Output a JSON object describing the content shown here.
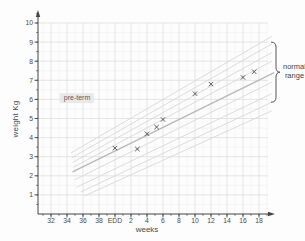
{
  "chart_data": {
    "type": "scatter",
    "title": "",
    "xlabel": "weeks",
    "ylabel": "weight Kg",
    "point_marker": "x",
    "grid": "on",
    "ylim": [
      0,
      10.5
    ],
    "y_ticks": [
      1,
      2,
      3,
      4,
      5,
      6,
      7,
      8,
      9,
      10
    ],
    "x_ticks": [
      {
        "label": "32",
        "w": -8
      },
      {
        "label": "34",
        "w": -6
      },
      {
        "label": "36",
        "w": -4
      },
      {
        "label": "38",
        "w": -2
      },
      {
        "label": "EDD",
        "w": 0
      },
      {
        "label": "2",
        "w": 2
      },
      {
        "label": "4",
        "w": 4
      },
      {
        "label": "6",
        "w": 6
      },
      {
        "label": "8",
        "w": 8
      },
      {
        "label": "10",
        "w": 10
      },
      {
        "label": "12",
        "w": 12
      },
      {
        "label": "14",
        "w": 14
      },
      {
        "label": "16",
        "w": 16
      },
      {
        "label": "18",
        "w": 18
      }
    ],
    "points": [
      {
        "week": 0,
        "kg": 3.45
      },
      {
        "week": 2.8,
        "kg": 3.4
      },
      {
        "week": 4,
        "kg": 4.2
      },
      {
        "week": 5.2,
        "kg": 4.55
      },
      {
        "week": 6,
        "kg": 4.95
      },
      {
        "week": 10,
        "kg": 6.3
      },
      {
        "week": 12,
        "kg": 6.8
      },
      {
        "week": 16,
        "kg": 7.15
      },
      {
        "week": 17.4,
        "kg": 7.45
      }
    ],
    "centile_band": {
      "lines": [
        {
          "w1": -3.8,
          "v1": 0.95,
          "w2": 19.6,
          "v2": 5.4,
          "emphasis": false
        },
        {
          "w1": -4.3,
          "v1": 1.15,
          "w2": 19.6,
          "v2": 5.85,
          "emphasis": false
        },
        {
          "w1": -4.8,
          "v1": 1.4,
          "w2": 19.6,
          "v2": 6.3,
          "emphasis": false
        },
        {
          "w1": -5.0,
          "v1": 1.8,
          "w2": 19.6,
          "v2": 6.9,
          "emphasis": false
        },
        {
          "w1": -5.3,
          "v1": 2.2,
          "w2": 19.9,
          "v2": 7.4,
          "emphasis": true
        },
        {
          "w1": -5.2,
          "v1": 2.45,
          "w2": 19.6,
          "v2": 8.0,
          "emphasis": false
        },
        {
          "w1": -5.3,
          "v1": 2.7,
          "w2": 19.6,
          "v2": 8.45,
          "emphasis": false
        },
        {
          "w1": -5.4,
          "v1": 2.95,
          "w2": 19.6,
          "v2": 8.9,
          "emphasis": false
        },
        {
          "w1": -5.5,
          "v1": 3.2,
          "w2": 19.6,
          "v2": 9.3,
          "emphasis": false
        }
      ]
    },
    "normal_range_brace": {
      "kg_top": 9.0,
      "kg_bottom": 5.85
    },
    "annotations": {
      "preterm": "pre-term",
      "normal_range_line1": "normal",
      "normal_range_line2": "range"
    },
    "colors": {
      "axis": "#444444",
      "grid_major": "#dedede",
      "grid_minor": "#f0f0f0",
      "band_faint": "#d8d8d8",
      "band_mid": "#b9b9b9",
      "marker": "#4a4a4a",
      "brace": "#555555",
      "tick_label": "#4a4a4a"
    }
  }
}
